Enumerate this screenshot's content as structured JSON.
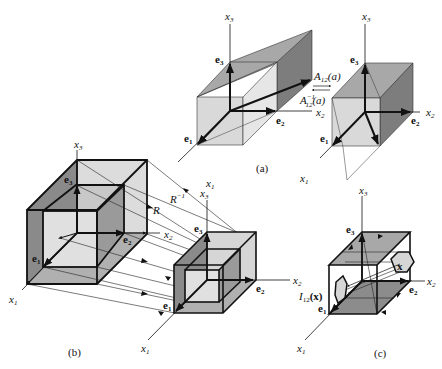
{
  "figure": {
    "panels": [
      {
        "id": "a",
        "caption": "(a)",
        "left_cube": {
          "axes": {
            "x1": "x",
            "x1_sub": "1",
            "x2": "x",
            "x2_sub": "2",
            "x3": "x",
            "x3_sub": "3"
          },
          "basis": {
            "e1": "e",
            "e1_sub": "1",
            "e2": "e",
            "e2_sub": "2",
            "e3": "e",
            "e3_sub": "3"
          }
        },
        "right_cube": {
          "axes": {
            "x1": "x",
            "x1_sub": "1",
            "x2": "x",
            "x2_sub": "2",
            "x3": "x",
            "x3_sub": "3"
          },
          "basis": {
            "e1": "e",
            "e1_sub": "1",
            "e2": "e",
            "e2_sub": "2",
            "e3": "e",
            "e3_sub": "3"
          }
        },
        "maps": {
          "forward": "A",
          "forward_sub": "12",
          "forward_arg": "(a)",
          "inverse": "A",
          "inverse_sup": "−1",
          "inverse_sub": "12",
          "inverse_arg": "(a)"
        }
      },
      {
        "id": "b",
        "caption": "(b)",
        "left_cube": {
          "axes": {
            "x1": "x",
            "x1_sub": "1",
            "x2": "x",
            "x2_sub": "2",
            "x3": "x",
            "x3_sub": "3"
          },
          "basis": {
            "e1": "e",
            "e1_sub": "1",
            "e2": "e",
            "e2_sub": "2",
            "e3": "e",
            "e3_sub": "3"
          }
        },
        "right_cube": {
          "axes": {
            "x1": "x",
            "x1_sub": "1",
            "x2": "x",
            "x2_sub": "2",
            "x3": "x",
            "x3_sub": "3"
          },
          "basis": {
            "e1": "e",
            "e1_sub": "1",
            "e2": "e",
            "e2_sub": "2",
            "e3": "e",
            "e3_sub": "3"
          }
        },
        "maps": {
          "forward": "R",
          "inverse": "R",
          "inverse_sup": "−1"
        }
      },
      {
        "id": "c",
        "caption": "(c)",
        "cube": {
          "axes": {
            "x1": "x",
            "x1_sub": "1",
            "x2": "x",
            "x2_sub": "2",
            "x3": "x",
            "x3_sub": "3"
          },
          "basis": {
            "e1": "e",
            "e1_sub": "1",
            "e2": "e",
            "e2_sub": "2",
            "e3": "e",
            "e3_sub": "3"
          }
        },
        "point_label": "x",
        "image_label": "I",
        "image_sub": "12",
        "image_arg": "(x)"
      }
    ],
    "colors": {
      "light_face": "#d9d9d9",
      "mid_face": "#a8a8a8",
      "dark_face": "#7d7d7d",
      "stroke": "#111111"
    }
  }
}
